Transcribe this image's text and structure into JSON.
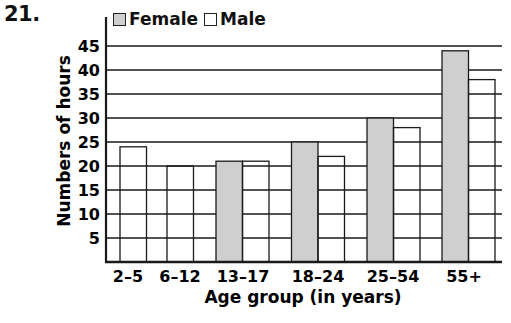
{
  "problem_number": "21.",
  "legend": {
    "female_label": "Female",
    "male_label": "Male"
  },
  "colors": {
    "female_fill": "#cfcfcf",
    "male_fill": "#ffffff",
    "stroke": "#1a1a1a"
  },
  "chart_data": {
    "type": "bar",
    "title": "",
    "xlabel": "Age group (in years)",
    "ylabel": "Numbers of hours",
    "ylim": [
      0,
      45
    ],
    "yticks": [
      5,
      10,
      15,
      20,
      25,
      30,
      35,
      40,
      45
    ],
    "grid": true,
    "legend_position": "top",
    "categories": [
      "2–5",
      "6–12",
      "13–17",
      "18–24",
      "25–54",
      "55+"
    ],
    "series": [
      {
        "name": "Female",
        "values": [
          null,
          null,
          21,
          25,
          30,
          44
        ]
      },
      {
        "name": "Male",
        "values": [
          24,
          20,
          21,
          22,
          28,
          38
        ]
      }
    ]
  }
}
